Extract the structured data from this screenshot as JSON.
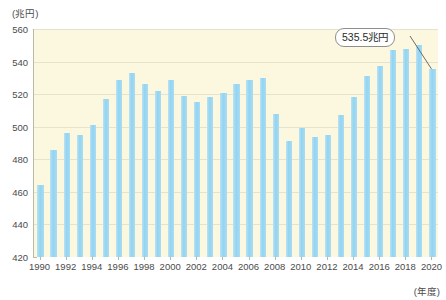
{
  "chart_data": {
    "type": "bar",
    "title": "",
    "subtitle": "",
    "xlabel": "(年度)",
    "ylabel": "(兆円)",
    "ylim": [
      420,
      560
    ],
    "ytick_step": 20,
    "yticks": [
      420,
      440,
      460,
      480,
      500,
      520,
      540,
      560
    ],
    "grid": true,
    "legend": "none",
    "bar_color": "#9fd8f2",
    "plot_background": "#fcf8e0",
    "axis_color": "#b9b9a8",
    "label_interval_years": 2,
    "categories": [
      "1990",
      "1991",
      "1992",
      "1993",
      "1994",
      "1995",
      "1996",
      "1997",
      "1998",
      "1999",
      "2000",
      "2001",
      "2002",
      "2003",
      "2004",
      "2005",
      "2006",
      "2007",
      "2008",
      "2009",
      "2010",
      "2011",
      "2012",
      "2013",
      "2014",
      "2015",
      "2016",
      "2017",
      "2018",
      "2019",
      "2020"
    ],
    "tick_labels": [
      "1990",
      "1992",
      "1994",
      "1996",
      "1998",
      "2000",
      "2002",
      "2004",
      "2006",
      "2008",
      "2010",
      "2012",
      "2014",
      "2016",
      "2018",
      "2020"
    ],
    "values": [
      464,
      486,
      496,
      495,
      501,
      517,
      529,
      533,
      526,
      522,
      529,
      519,
      515,
      518,
      521,
      526,
      529,
      530,
      508,
      491,
      499,
      494,
      495,
      507,
      518,
      531,
      537,
      547,
      548,
      550,
      535.5
    ],
    "annotations": [
      {
        "label": "535.5兆円",
        "category": "2020",
        "value": 535.5
      }
    ]
  },
  "callout": {
    "text": "535.5兆円"
  },
  "axis": {
    "y_unit": "(兆円)",
    "x_unit": "(年度)"
  }
}
